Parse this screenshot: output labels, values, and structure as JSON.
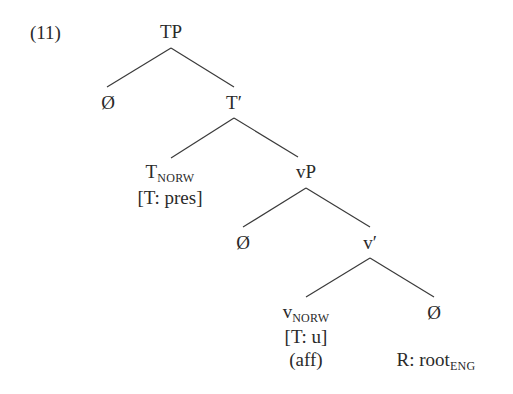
{
  "example_number": "(11)",
  "nodes": {
    "tp": "TP",
    "null1": "Ø",
    "tbar": "T′",
    "t_head": {
      "main": "T",
      "sub": "NORW",
      "feature": "[T: pres]"
    },
    "vp": "vP",
    "null2": "Ø",
    "vbar": "v′",
    "v_head": {
      "main": "v",
      "sub": "NORW",
      "feature": "[T: u]",
      "note": "(aff)"
    },
    "null3": "Ø",
    "root": {
      "main": "R: root",
      "sub": "ENG"
    }
  },
  "colors": {
    "text": "#2a2a2a",
    "line": "#3a3a3a"
  }
}
